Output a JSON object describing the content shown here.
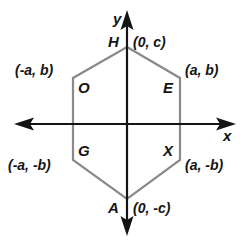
{
  "figure": {
    "colors": {
      "axis": "#141414",
      "polygon_stroke": "#8a8a8a",
      "text": "#141414",
      "background": "#ffffff"
    },
    "axes": {
      "x_label": "x",
      "y_label": "y"
    },
    "polygon": {
      "name": "hexagon",
      "vertex_count": 6
    },
    "vertices": [
      {
        "letter": "H",
        "coordinate": "(0, c)"
      },
      {
        "letter": "E",
        "coordinate": "(a, b)"
      },
      {
        "letter": "X",
        "coordinate": "(a, -b)"
      },
      {
        "letter": "A",
        "coordinate": "(0, -c)"
      },
      {
        "letter": "G",
        "coordinate": "(-a, -b)"
      },
      {
        "letter": "O",
        "coordinate": "(-a, b)"
      }
    ]
  }
}
